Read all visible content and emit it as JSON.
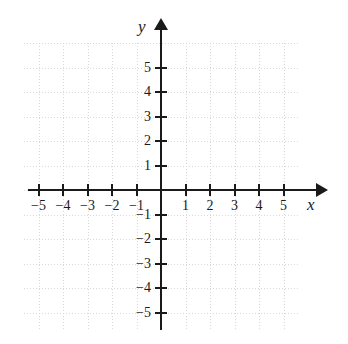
{
  "chart_data": {
    "type": "scatter",
    "title": "",
    "subtitle": "",
    "xlabel": "x",
    "ylabel": "y",
    "xlim": [
      -6,
      6.5
    ],
    "ylim": [
      -6,
      6
    ],
    "x_ticks": [
      -5,
      -4,
      -3,
      -2,
      -1,
      1,
      2,
      3,
      4,
      5
    ],
    "y_ticks": [
      5,
      4,
      3,
      2,
      1,
      -1,
      -2,
      -3,
      -4,
      -5
    ],
    "x_tick_labels": [
      "−5",
      "−4",
      "−3",
      "−2",
      "−1",
      "1",
      "2",
      "3",
      "4",
      "5"
    ],
    "y_tick_labels": [
      "5",
      "4",
      "3",
      "2",
      "1",
      "−1",
      "−2",
      "−3",
      "−4",
      "−5"
    ],
    "grid": true,
    "grid_style": "dotted",
    "grid_spacing": 1,
    "legend": null,
    "series": [],
    "values": [],
    "annotations": [],
    "axis_arrows": [
      "x-positive",
      "y-positive"
    ],
    "origin_label": ""
  },
  "axes": {
    "x_label": "x",
    "y_label": "y"
  },
  "colors": {
    "axis": "#1a1a1a",
    "grid": "#d9d9d9",
    "background": "#ffffff",
    "text": "#1a1a1a"
  }
}
